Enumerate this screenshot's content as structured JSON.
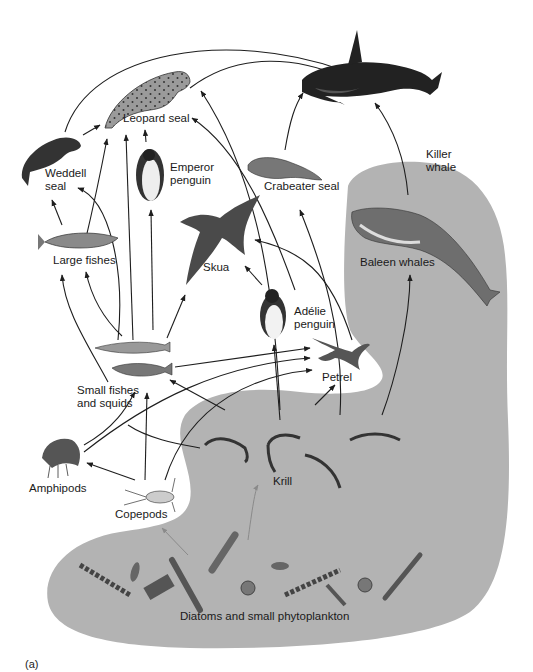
{
  "figure": {
    "panel_label": "(a)",
    "colors": {
      "ocean_region": "#b3b3b3",
      "background": "#ffffff",
      "arrow": "#1e1e1e",
      "arrow_faint": "#8a8a8a",
      "organism_dark": "#2a2a2a",
      "organism_mid": "#6e6e6e",
      "organism_light": "#a8a8a8"
    }
  },
  "organisms": {
    "killer_whale": {
      "line1": "Killer",
      "line2": "whale",
      "icon": "orca-icon"
    },
    "leopard_seal": {
      "line1": "Leopard seal",
      "icon": "spotted-seal-icon"
    },
    "weddell_seal": {
      "line1": "Weddell",
      "line2": "seal",
      "icon": "seal-icon"
    },
    "emperor_penguin": {
      "line1": "Emperor",
      "line2": "penguin",
      "icon": "penguin-icon"
    },
    "crabeater_seal": {
      "line1": "Crabeater seal",
      "icon": "seal-icon"
    },
    "large_fishes": {
      "line1": "Large fishes",
      "icon": "fish-icon"
    },
    "skua": {
      "line1": "Skua",
      "icon": "bird-icon"
    },
    "baleen_whales": {
      "line1": "Baleen whales",
      "icon": "whale-icon"
    },
    "adelie_penguin": {
      "line1": "Adélie",
      "line2": "penguin",
      "icon": "penguin-icon"
    },
    "petrel": {
      "line1": "Petrel",
      "icon": "bird-icon"
    },
    "small_fishes_squids": {
      "line1": "Small fishes",
      "line2": "and squids",
      "icon": "fish-squid-icon"
    },
    "amphipods": {
      "line1": "Amphipods",
      "icon": "amphipod-icon"
    },
    "copepods": {
      "line1": "Copepods",
      "icon": "copepod-icon"
    },
    "krill": {
      "line1": "Krill",
      "icon": "shrimp-icon"
    },
    "phytoplankton": {
      "line1": "Diatoms and small phytoplankton",
      "icon": "diatom-icon"
    }
  },
  "links": [
    {
      "from": "Leopard seal",
      "to": "Killer whale"
    },
    {
      "from": "Weddell seal",
      "to": "Killer whale"
    },
    {
      "from": "Crabeater seal",
      "to": "Killer whale"
    },
    {
      "from": "Baleen whales",
      "to": "Killer whale"
    },
    {
      "from": "Weddell seal",
      "to": "Leopard seal"
    },
    {
      "from": "Emperor penguin",
      "to": "Leopard seal"
    },
    {
      "from": "Large fishes",
      "to": "Leopard seal"
    },
    {
      "from": "Adélie penguin",
      "to": "Leopard seal"
    },
    {
      "from": "Small fishes and squids",
      "to": "Leopard seal"
    },
    {
      "from": "Krill",
      "to": "Leopard seal"
    },
    {
      "from": "Large fishes",
      "to": "Weddell seal"
    },
    {
      "from": "Small fishes and squids",
      "to": "Weddell seal"
    },
    {
      "from": "Small fishes and squids",
      "to": "Emperor penguin"
    },
    {
      "from": "Krill",
      "to": "Crabeater seal"
    },
    {
      "from": "Small fishes and squids",
      "to": "Large fishes"
    },
    {
      "from": "Amphipods",
      "to": "Large fishes"
    },
    {
      "from": "Small fishes and squids",
      "to": "Skua"
    },
    {
      "from": "Adélie penguin",
      "to": "Skua"
    },
    {
      "from": "Petrel",
      "to": "Skua"
    },
    {
      "from": "Krill",
      "to": "Baleen whales"
    },
    {
      "from": "Krill",
      "to": "Adélie penguin"
    },
    {
      "from": "Small fishes and squids",
      "to": "Petrel"
    },
    {
      "from": "Amphipods",
      "to": "Petrel"
    },
    {
      "from": "Copepods",
      "to": "Petrel"
    },
    {
      "from": "Krill",
      "to": "Petrel"
    },
    {
      "from": "Amphipods",
      "to": "Small fishes and squids"
    },
    {
      "from": "Copepods",
      "to": "Small fishes and squids"
    },
    {
      "from": "Krill",
      "to": "Small fishes and squids"
    },
    {
      "from": "Copepods",
      "to": "Amphipods"
    },
    {
      "from": "Diatoms and small phytoplankton",
      "to": "Copepods"
    },
    {
      "from": "Diatoms and small phytoplankton",
      "to": "Krill"
    }
  ]
}
